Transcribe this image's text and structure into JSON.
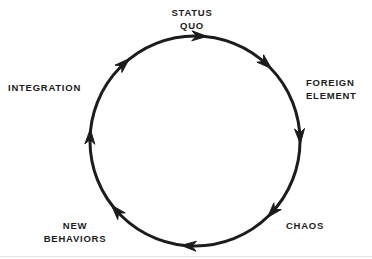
{
  "diagram": {
    "type": "cycle",
    "direction": "clockwise",
    "background_color": "#ffffff",
    "stroke_color": "#1c1c1c",
    "text_color": "#1c1c1c",
    "circle": {
      "center_x": 195,
      "center_y": 141,
      "radius": 105,
      "stroke_width": 3
    },
    "nodes": [
      {
        "id": "status-quo",
        "label": "STATUS\nQUO",
        "angle_deg": 270,
        "position": "top"
      },
      {
        "id": "foreign-element",
        "label": "FOREIGN\nELEMENT",
        "angle_deg": 340,
        "position": "right"
      },
      {
        "id": "chaos",
        "label": "CHAOS",
        "angle_deg": 40,
        "position": "bottom-right"
      },
      {
        "id": "new-behaviors",
        "label": "NEW\nBEHAVIORS",
        "angle_deg": 140,
        "position": "bottom-left"
      },
      {
        "id": "integration",
        "label": "INTEGRATION",
        "angle_deg": 200,
        "position": "left"
      }
    ],
    "arrowheads": [
      {
        "id": "arrow-top",
        "angle_deg": 272
      },
      {
        "id": "arrow-upper-right",
        "angle_deg": 312
      },
      {
        "id": "arrow-right",
        "angle_deg": 357
      },
      {
        "id": "arrow-lower-right",
        "angle_deg": 42
      },
      {
        "id": "arrow-bottom",
        "angle_deg": 93
      },
      {
        "id": "arrow-lower-left",
        "angle_deg": 138
      },
      {
        "id": "arrow-left",
        "angle_deg": 182
      },
      {
        "id": "arrow-upper-left",
        "angle_deg": 227
      }
    ]
  }
}
